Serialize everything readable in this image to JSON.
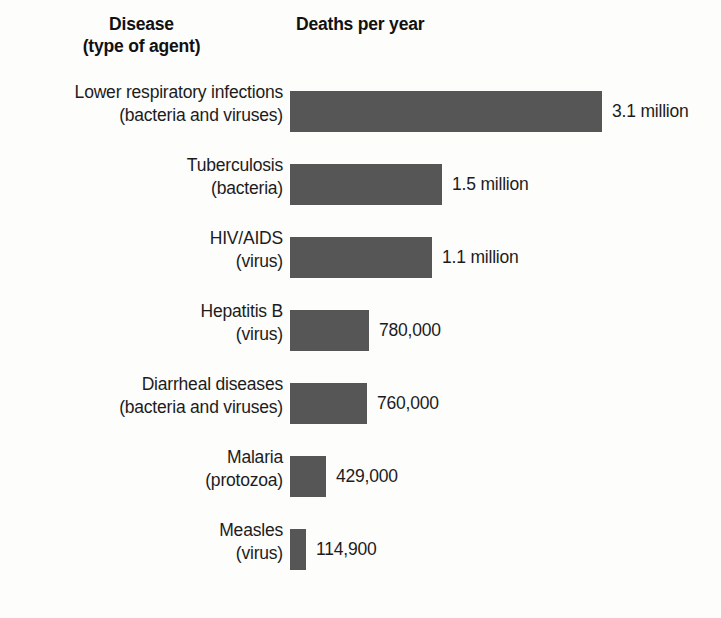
{
  "header": {
    "disease_col_line1": "Disease",
    "disease_col_line2": "(type of agent)",
    "deaths_col": "Deaths per year"
  },
  "colors": {
    "bar": "#565656",
    "text": "#1c1c1c",
    "background": "#fdfdfc"
  },
  "rows": [
    {
      "disease": "Lower respiratory infections",
      "agent": "(bacteria and viruses)",
      "value_label": "3.1 million",
      "value": 3100000,
      "bar_px": 312
    },
    {
      "disease": "Tuberculosis",
      "agent": "(bacteria)",
      "value_label": "1.5 million",
      "value": 1500000,
      "bar_px": 152
    },
    {
      "disease": "HIV/AIDS",
      "agent": "(virus)",
      "value_label": "1.1 million",
      "value": 1100000,
      "bar_px": 142
    },
    {
      "disease": "Hepatitis B",
      "agent": "(virus)",
      "value_label": "780,000",
      "value": 780000,
      "bar_px": 79
    },
    {
      "disease": "Diarrheal diseases",
      "agent": "(bacteria and viruses)",
      "value_label": "760,000",
      "value": 760000,
      "bar_px": 77
    },
    {
      "disease": "Malaria",
      "agent": "(protozoa)",
      "value_label": "429,000",
      "value": 429000,
      "bar_px": 36
    },
    {
      "disease": "Measles",
      "agent": "(virus)",
      "value_label": "114,900",
      "value": 114900,
      "bar_px": 16
    }
  ],
  "chart_data": {
    "type": "bar",
    "orientation": "horizontal",
    "title": "Deaths per year",
    "xlabel": "Deaths per year",
    "ylabel": "Disease (type of agent)",
    "grid": false,
    "legend": null,
    "categories": [
      "Lower respiratory infections (bacteria and viruses)",
      "Tuberculosis (bacteria)",
      "HIV/AIDS (virus)",
      "Hepatitis B (virus)",
      "Diarrheal diseases (bacteria and viruses)",
      "Malaria (protozoa)",
      "Measles (virus)"
    ],
    "values": [
      3100000,
      1500000,
      1100000,
      780000,
      760000,
      429000,
      114900
    ],
    "value_labels": [
      "3.1 million",
      "1.5 million",
      "1.1 million",
      "780,000",
      "760,000",
      "429,000",
      "114,900"
    ],
    "xlim": [
      0,
      3100000
    ]
  }
}
